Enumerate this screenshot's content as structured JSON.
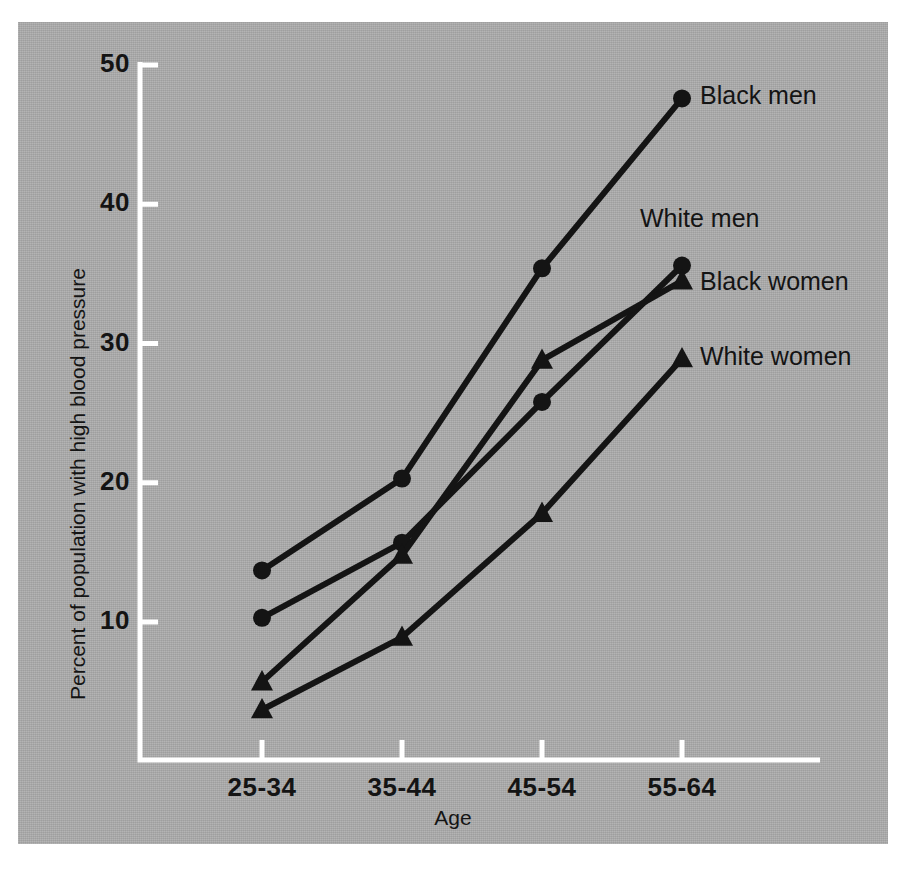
{
  "figure": {
    "background_color": "#adadad",
    "ink_color": "#141414",
    "axis_color": "#ffffff"
  },
  "chart_data": {
    "type": "line",
    "title": "",
    "subtitle": "",
    "xlabel": "Age",
    "ylabel": "Percent of population with high blood pressure",
    "categories": [
      "25-34",
      "35-44",
      "45-54",
      "55-64"
    ],
    "xtick_labels": [
      "25-34",
      "35-44",
      "45-54",
      "55-64"
    ],
    "ytick_labels": [
      "10",
      "20",
      "30",
      "40",
      "50"
    ],
    "ytick_values": [
      10,
      20,
      30,
      40,
      50
    ],
    "ylim": [
      0,
      53
    ],
    "grid": false,
    "legend": "inline-endpoint-labels",
    "series": [
      {
        "name": "Black men",
        "label": "Black men",
        "marker": "circle",
        "values": [
          13.7,
          20.3,
          35.4,
          47.6
        ]
      },
      {
        "name": "White men",
        "label": "White men",
        "marker": "circle",
        "values": [
          10.3,
          15.7,
          25.8,
          35.6
        ]
      },
      {
        "name": "Black women",
        "label": "Black women",
        "marker": "triangle",
        "values": [
          5.7,
          14.8,
          28.8,
          34.5
        ]
      },
      {
        "name": "White women",
        "label": "White women",
        "marker": "triangle",
        "values": [
          3.7,
          8.9,
          17.8,
          28.9
        ]
      }
    ],
    "annotations": [
      {
        "text": "Black men",
        "for": "Black men"
      },
      {
        "text": "White men",
        "for": "White men"
      },
      {
        "text": "Black women",
        "for": "Black women"
      },
      {
        "text": "White women",
        "for": "White women"
      }
    ]
  }
}
